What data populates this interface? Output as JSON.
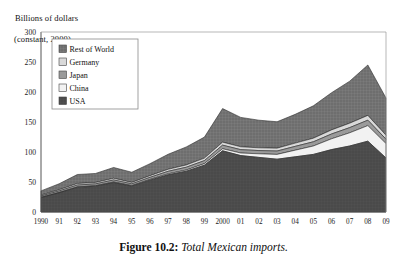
{
  "axis_label": {
    "line1": "Billions of dollars",
    "line2": "(constant, 2000)"
  },
  "caption": {
    "prefix": "Figure 10.2:",
    "text": "Total Mexican imports."
  },
  "colors": {
    "rest_of_world": "#6e6e6e",
    "germany": "#d9d9d9",
    "japan": "#9a9a9a",
    "china": "#f2f2f2",
    "usa": "#4a4a4a",
    "axis": "#555555",
    "text": "#111111"
  },
  "chart_data": {
    "type": "area",
    "stacked": true,
    "title": "Total Mexican imports.",
    "xlabel": "",
    "ylabel": "Billions of dollars (constant, 2000)",
    "ylim": [
      0,
      300
    ],
    "yticks": [
      0,
      50,
      100,
      150,
      200,
      250,
      300
    ],
    "grid": false,
    "legend_position": "upper-left-inside",
    "categories": [
      "1990",
      "91",
      "92",
      "93",
      "94",
      "95",
      "96",
      "97",
      "98",
      "99",
      "2000",
      "01",
      "02",
      "03",
      "04",
      "05",
      "06",
      "07",
      "08",
      "09"
    ],
    "x": [
      1990,
      1991,
      1992,
      1993,
      1994,
      1995,
      1996,
      1997,
      1998,
      1999,
      2000,
      2001,
      2002,
      2003,
      2004,
      2005,
      2006,
      2007,
      2008,
      2009
    ],
    "series": [
      {
        "name": "USA",
        "values": [
          24,
          32,
          41,
          43,
          49,
          43,
          53,
          62,
          68,
          78,
          102,
          94,
          91,
          88,
          92,
          96,
          104,
          110,
          118,
          90
        ]
      },
      {
        "name": "China",
        "values": [
          0.4,
          0.5,
          0.7,
          0.8,
          1.0,
          0.9,
          1.2,
          1.6,
          2.0,
          2.6,
          3.4,
          4.3,
          6.0,
          8.0,
          11.0,
          14.0,
          18.0,
          22.0,
          26.0,
          24.0
        ]
      },
      {
        "name": "Japan",
        "values": [
          2.2,
          2.6,
          3.2,
          3.0,
          3.4,
          3.0,
          3.5,
          4.2,
          4.6,
          5.0,
          6.0,
          5.6,
          5.4,
          5.6,
          6.4,
          7.0,
          8.0,
          8.6,
          9.0,
          7.4
        ]
      },
      {
        "name": "Germany",
        "values": [
          1.6,
          2.0,
          2.6,
          2.4,
          2.8,
          2.4,
          2.8,
          3.4,
          3.8,
          4.2,
          5.0,
          4.8,
          4.6,
          4.8,
          5.4,
          6.0,
          6.8,
          7.4,
          8.0,
          6.6
        ]
      },
      {
        "name": "Rest of World",
        "values": [
          7,
          10,
          15,
          15,
          18,
          17,
          20,
          25,
          30,
          35,
          56,
          49,
          46,
          44,
          48,
          54,
          62,
          70,
          84,
          62
        ]
      }
    ],
    "totals": [
      35,
      47,
      62,
      64,
      74,
      66,
      81,
      96,
      108,
      125,
      172,
      158,
      153,
      150,
      163,
      177,
      199,
      218,
      245,
      190
    ],
    "legend": [
      "Rest of World",
      "Germany",
      "Japan",
      "China",
      "USA"
    ]
  }
}
